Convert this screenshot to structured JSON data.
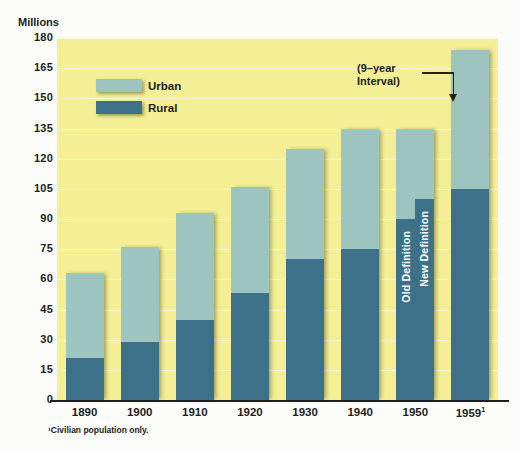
{
  "chart_data": {
    "type": "bar",
    "title": "",
    "subtitle": "",
    "ylabel": "Millions",
    "xlabel": "",
    "ylim": [
      0,
      180
    ],
    "yticks": [
      0,
      15,
      30,
      45,
      60,
      75,
      90,
      105,
      120,
      135,
      150,
      165,
      180
    ],
    "grid": true,
    "stacked": true,
    "legend_position": "upper-left-inside",
    "categories": [
      "1890",
      "1900",
      "1910",
      "1920",
      "1930",
      "1940",
      "1950",
      "1959"
    ],
    "series": [
      {
        "name": "Rural",
        "color": "#3d7189",
        "values": [
          21,
          29,
          40,
          53,
          70,
          75,
          90,
          105
        ]
      },
      {
        "name": "Urban",
        "color": "#9ec4c0",
        "values": [
          42,
          47,
          53,
          53,
          55,
          60,
          45,
          69
        ]
      }
    ],
    "totals": [
      63,
      76,
      93,
      106,
      125,
      135,
      135,
      174
    ],
    "split_bar": {
      "category": "1950",
      "note": "1950 bar shown twice: rural under old and new urban/rural definitions",
      "halves": [
        {
          "label": "Old Definition",
          "rural": 90,
          "total": 135
        },
        {
          "label": "New Definition",
          "rural": 100,
          "total": 135
        }
      ]
    },
    "annotations": [
      {
        "text_line1": "(9–year",
        "text_line2": "Interval)",
        "points_to": "1959"
      }
    ],
    "footnote": "¹Civilian population only.",
    "category_superscripts": {
      "1959": "1"
    }
  },
  "axis": {
    "y_title": "Millions",
    "ticks": [
      "180",
      "165",
      "150",
      "135",
      "120",
      "105",
      "90",
      "75",
      "60",
      "45",
      "30",
      "15",
      "0"
    ],
    "x_labels": [
      "1890",
      "1900",
      "1910",
      "1920",
      "1930",
      "1940",
      "1950",
      "1959"
    ]
  },
  "legend": {
    "items": [
      {
        "label": "Urban",
        "color": "#9ec4c0"
      },
      {
        "label": "Rural",
        "color": "#3d7189"
      }
    ]
  },
  "annotation": {
    "line1": "(9–year",
    "line2": "Interval)"
  },
  "inbar_labels": {
    "old_definition": "Old Definition",
    "new_definition": "New Definition"
  },
  "footnote": {
    "text": "¹Civilian population only."
  },
  "colors": {
    "plot_background": "#f4ef95",
    "page_background": "#fcfcfa",
    "urban": "#9ec4c0",
    "rural": "#3d7189",
    "axis": "#1d1d1b",
    "gridline": "#fbf9d6"
  }
}
